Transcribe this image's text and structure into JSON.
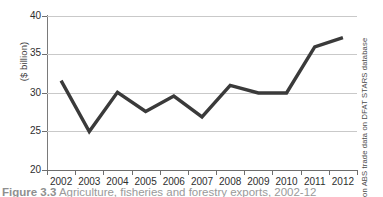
{
  "chart_data": {
    "type": "line",
    "title": "",
    "xlabel": "",
    "ylabel": "($ billion)",
    "categories": [
      "2002",
      "2003",
      "2004",
      "2005",
      "2006",
      "2007",
      "2008",
      "2009",
      "2010",
      "2011",
      "2012"
    ],
    "values": [
      31.6,
      25.0,
      30.1,
      27.6,
      29.6,
      26.9,
      31.0,
      30.0,
      30.0,
      36.0,
      37.2
    ],
    "series": [
      {
        "name": "Agriculture, fisheries and forestry exports",
        "values": [
          31.6,
          25.0,
          30.1,
          27.6,
          29.6,
          26.9,
          31.0,
          30.0,
          30.0,
          36.0,
          37.2
        ]
      }
    ],
    "ylim": [
      20,
      40
    ],
    "y_ticks": [
      20,
      25,
      30,
      35,
      40
    ],
    "y_tick_labels": [
      "20",
      "25",
      "30",
      "35",
      "40"
    ],
    "grid": true,
    "legend": "none",
    "line_color": "#3a3a3a",
    "grid_color": "#c9c9c9",
    "axis_color": "#6e6e6e"
  },
  "axes": {
    "y_title": "($ billion)"
  },
  "source_note": "Based on ABS trade data on DFAT STARS database",
  "caption": {
    "number": "Figure 3.3",
    "text": "Agriculture, fisheries and forestry exports, 2002-12"
  }
}
